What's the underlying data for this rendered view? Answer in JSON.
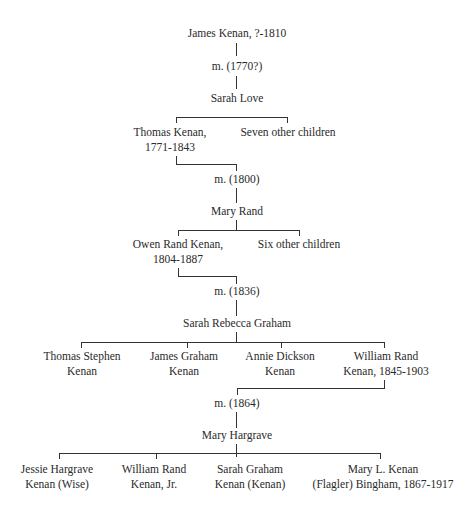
{
  "tree": {
    "gen1": {
      "ancestor": "James Kenan, ?-1810",
      "marriage": "m. (1770?)",
      "spouse": "Sarah Love"
    },
    "gen2": {
      "children": [
        {
          "line1": "Thomas Kenan,",
          "line2": "1771-1843"
        },
        {
          "line1": "Seven other children",
          "line2": ""
        }
      ],
      "marriage": "m. (1800)",
      "spouse": "Mary Rand"
    },
    "gen3": {
      "children": [
        {
          "line1": "Owen Rand Kenan,",
          "line2": "1804-1887"
        },
        {
          "line1": "Six other children",
          "line2": ""
        }
      ],
      "marriage": "m. (1836)",
      "spouse": "Sarah Rebecca Graham"
    },
    "gen4": {
      "children": [
        {
          "line1": "Thomas Stephen",
          "line2": "Kenan"
        },
        {
          "line1": "James Graham",
          "line2": "Kenan"
        },
        {
          "line1": "Annie Dickson",
          "line2": "Kenan"
        },
        {
          "line1": "William Rand",
          "line2": "Kenan, 1845-1903"
        }
      ],
      "marriage": "m. (1864)",
      "spouse": "Mary Hargrave"
    },
    "gen5": {
      "children": [
        {
          "line1": "Jessie Hargrave",
          "line2": "Kenan (Wise)"
        },
        {
          "line1": "William Rand",
          "line2": "Kenan, Jr."
        },
        {
          "line1": "Sarah Graham",
          "line2": "Kenan (Kenan)"
        },
        {
          "line1": "Mary L. Kenan",
          "line2": "(Flagler) Bingham, 1867-1917"
        }
      ]
    }
  },
  "colors": {
    "text": "#2a2a2a",
    "line": "#333333",
    "background": "#ffffff"
  }
}
